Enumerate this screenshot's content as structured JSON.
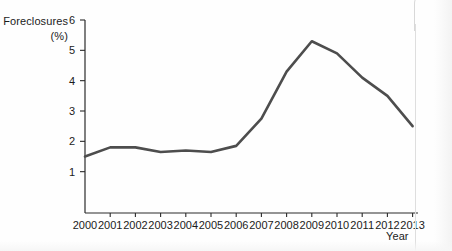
{
  "chart_data": {
    "type": "line",
    "title": "",
    "ylabel": "Foreclosures",
    "ylabel_unit": "(%)",
    "xlabel": "Year",
    "categories": [
      "2000",
      "2001",
      "2002",
      "2003",
      "2004",
      "2005",
      "2006",
      "2007",
      "2008",
      "2009",
      "2010",
      "2011",
      "2012",
      "2013"
    ],
    "x": [
      2000,
      2001,
      2002,
      2003,
      2004,
      2005,
      2006,
      2007,
      2008,
      2009,
      2010,
      2011,
      2012,
      2013
    ],
    "values": [
      1.5,
      1.8,
      1.8,
      1.65,
      1.7,
      1.65,
      1.85,
      2.75,
      4.3,
      5.3,
      4.9,
      4.1,
      3.5,
      2.5
    ],
    "series": [
      {
        "name": "Foreclosures",
        "values": [
          1.5,
          1.8,
          1.8,
          1.65,
          1.7,
          1.65,
          1.85,
          2.75,
          4.3,
          5.3,
          4.9,
          4.1,
          3.5,
          2.5
        ],
        "color": "#4d4d4d"
      }
    ],
    "ylim": [
      0,
      6
    ],
    "yticks": [
      1,
      2,
      3,
      4,
      5,
      6
    ],
    "ytick_labels": [
      "1",
      "2",
      "3",
      "4",
      "5",
      "6"
    ],
    "xlim": [
      2000,
      2013
    ],
    "grid": false,
    "legend": false,
    "legend_position": "none",
    "annotations": []
  },
  "axis": {
    "y_title": "Foreclosures",
    "y_unit": "(%)",
    "x_title": "Year"
  },
  "ticks": {
    "y": [
      "1",
      "2",
      "3",
      "4",
      "5",
      "6"
    ],
    "x": [
      "2000",
      "2001",
      "2002",
      "2003",
      "2004",
      "2005",
      "2006",
      "2007",
      "2008",
      "2009",
      "2010",
      "2011",
      "2012",
      "2013"
    ]
  },
  "colors": {
    "line": "#4d4d4d",
    "axis": "#2a2a2a",
    "text": "#1b1b1b",
    "background": "#fefefe"
  }
}
